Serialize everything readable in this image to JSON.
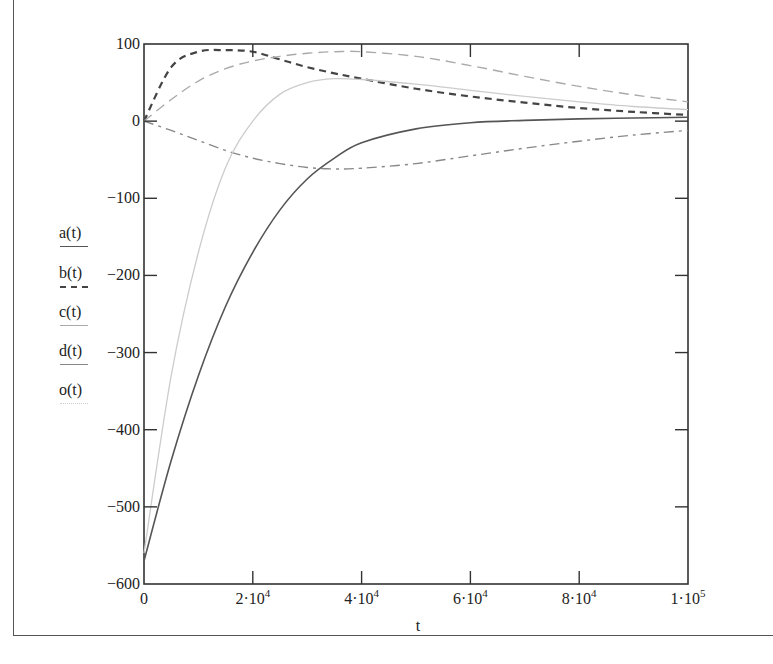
{
  "chart_data": {
    "type": "line",
    "title": "",
    "xlabel": "t",
    "ylabel": "",
    "xlim": [
      0,
      100000
    ],
    "ylim": [
      -600,
      100
    ],
    "grid": false,
    "legend_position": "left",
    "x_ticks": [
      0,
      20000,
      40000,
      60000,
      80000,
      100000
    ],
    "x_tick_labels": [
      "0",
      "2·10^4",
      "4·10^4",
      "6·10^4",
      "8·10^4",
      "1·10^5"
    ],
    "y_ticks": [
      100,
      0,
      -100,
      -200,
      -300,
      -400,
      -500,
      -600
    ],
    "y_tick_labels": [
      "100",
      "0",
      "−100",
      "−200",
      "−300",
      "−400",
      "−500",
      "−600"
    ],
    "x": [
      0,
      5000,
      10000,
      15000,
      20000,
      25000,
      30000,
      35000,
      40000,
      50000,
      60000,
      70000,
      80000,
      90000,
      100000
    ],
    "series": [
      {
        "name": "a(t)",
        "style": "solid",
        "color": "#555555",
        "values": [
          -570,
          -440,
          -330,
          -240,
          -170,
          -115,
          -75,
          -48,
          -28,
          -10,
          -2,
          1,
          3,
          4,
          5
        ]
      },
      {
        "name": "b(t)",
        "style": "dashed-heavy",
        "color": "#444444",
        "values": [
          0,
          70,
          90,
          92,
          90,
          80,
          70,
          62,
          55,
          42,
          32,
          24,
          17,
          12,
          8
        ]
      },
      {
        "name": "c(t)",
        "style": "dashed-light",
        "color": "#aaaaaa",
        "values": [
          0,
          28,
          52,
          68,
          78,
          84,
          88,
          90,
          90,
          84,
          72,
          58,
          45,
          34,
          25
        ]
      },
      {
        "name": "d(t)",
        "style": "dash-dot",
        "color": "#888888",
        "values": [
          0,
          -12,
          -25,
          -38,
          -48,
          -55,
          -60,
          -62,
          -61,
          -55,
          -45,
          -35,
          -26,
          -18,
          -12
        ]
      },
      {
        "name": "o(t)",
        "style": "solid-light",
        "color": "#cccccc",
        "values": [
          -560,
          -330,
          -170,
          -60,
          0,
          35,
          50,
          55,
          54,
          48,
          40,
          32,
          25,
          19,
          15
        ]
      }
    ]
  },
  "legend": {
    "items": [
      {
        "label": "a(t)"
      },
      {
        "label": "b(t)"
      },
      {
        "label": "c(t)"
      },
      {
        "label": "d(t)"
      },
      {
        "label": "o(t)"
      }
    ]
  },
  "axes": {
    "xlabel": "t",
    "x_ticks": [
      {
        "base": "0",
        "exp": ""
      },
      {
        "base": "2·10",
        "exp": "4"
      },
      {
        "base": "4·10",
        "exp": "4"
      },
      {
        "base": "6·10",
        "exp": "4"
      },
      {
        "base": "8·10",
        "exp": "4"
      },
      {
        "base": "1·10",
        "exp": "5"
      }
    ],
    "y_ticks": [
      "100",
      "0",
      "−100",
      "−200",
      "−300",
      "−400",
      "−500",
      "−600"
    ]
  }
}
